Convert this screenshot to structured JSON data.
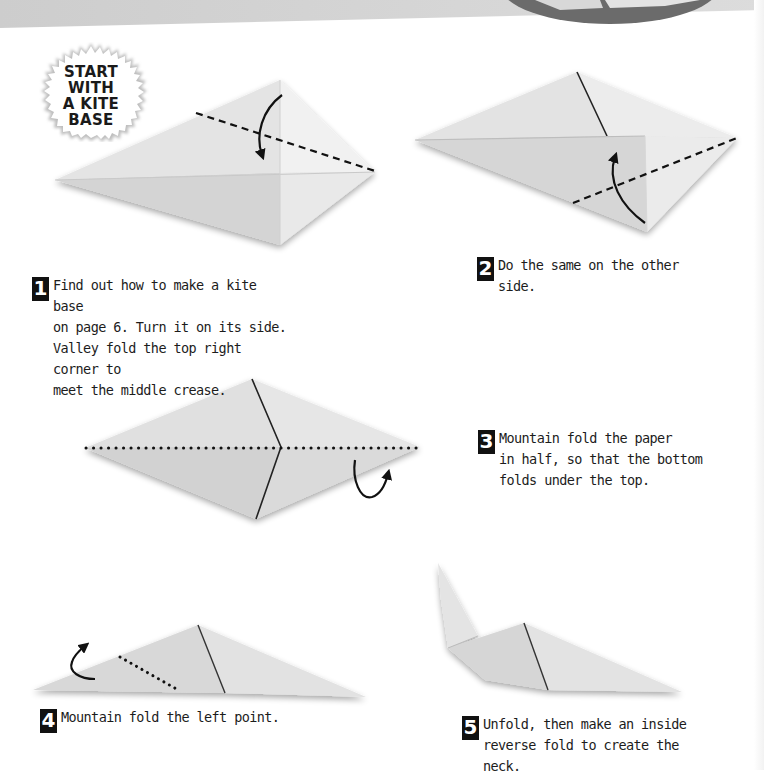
{
  "page": {
    "background_color": "#ffffff",
    "header_band_color": "#cfcfcf",
    "header_circle_color": "#6b6b6b"
  },
  "badge": {
    "icon": "starburst-badge-icon",
    "lines": [
      "START",
      "WITH",
      "A KITE",
      "BASE"
    ]
  },
  "steps": [
    {
      "number": "1",
      "text": "Find out how to make a kite base\non page 6. Turn it on its side.\nValley fold the top right corner to\nmeet the middle crease.",
      "diagram": "kite-base-valley-fold-diagram",
      "fold_line": "dashed",
      "arrow": "curved-arrow-down"
    },
    {
      "number": "2",
      "text": "Do the same on the other side.",
      "diagram": "kite-other-side-fold-diagram",
      "fold_line": "dashed",
      "arrow": "curved-arrow-up"
    },
    {
      "number": "3",
      "text": "Mountain fold the paper\nin half, so that the bottom\nfolds under the top.",
      "diagram": "diamond-mountain-fold-diagram",
      "fold_line": "dotted",
      "arrow": "curved-arrow-under"
    },
    {
      "number": "4",
      "text": "Mountain fold the left point.",
      "diagram": "triangle-left-point-fold-diagram",
      "fold_line": "dotted",
      "arrow": "curved-arrow-back"
    },
    {
      "number": "5",
      "text": "Unfold, then make an inside\nreverse fold to create the neck.",
      "diagram": "inside-reverse-fold-neck-diagram"
    }
  ],
  "colors": {
    "paper_light": "#ececec",
    "paper_mid": "#d9d9d9",
    "paper_dark": "#c4c4c4",
    "line": "#111111",
    "step_number_bg": "#111111",
    "step_number_fg": "#ffffff"
  }
}
